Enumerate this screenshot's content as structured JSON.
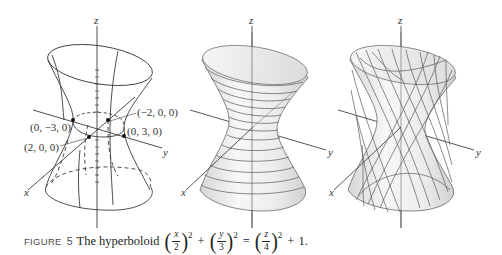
{
  "figure": {
    "panels": [
      {
        "id": "wireframe",
        "axis_labels": {
          "x": "x",
          "y": "y",
          "z": "z"
        },
        "points": [
          {
            "label": "(0, −3, 0)"
          },
          {
            "label": "(−2, 0, 0)"
          },
          {
            "label": "(0, 3, 0)"
          },
          {
            "label": "(2, 0, 0)"
          }
        ]
      },
      {
        "id": "horizontal-traces",
        "axis_labels": {
          "x": "x",
          "y": "y",
          "z": "z"
        }
      },
      {
        "id": "ruled-lines",
        "axis_labels": {
          "x": "x",
          "y": "y",
          "z": "z"
        }
      }
    ]
  },
  "caption": {
    "label": "FIGURE",
    "number": "5",
    "text": "The hyperboloid",
    "equation": {
      "term1": {
        "num": "x",
        "den": "2",
        "exp": "2"
      },
      "plus1": "+",
      "term2": {
        "num": "y",
        "den": "3",
        "exp": "2"
      },
      "equals": "=",
      "term3": {
        "num": "z",
        "den": "4",
        "exp": "2"
      },
      "plus2": "+",
      "const": "1."
    }
  },
  "colors": {
    "line": "#3a3a3a",
    "surface_light": "#f2f2f2",
    "surface_shade": "#d4d4d4"
  }
}
